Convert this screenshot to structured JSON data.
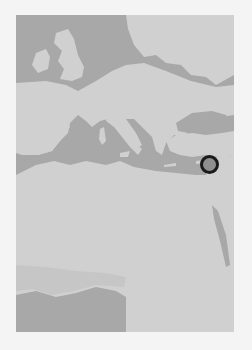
{
  "map": {
    "region": "Europe, Mediterranean and North Africa",
    "style": "grayscale",
    "colors": {
      "water": "#a8a8a8",
      "land": "#d0d0d0",
      "page_background": "#f4f4f4",
      "marker_stroke": "#1a1a1a",
      "marker_fill": "#8f8f8f"
    },
    "markers": [
      {
        "name": "location-marker",
        "approx_location": "Eastern Mediterranean coast (Levant)",
        "shape": "circle"
      }
    ]
  }
}
